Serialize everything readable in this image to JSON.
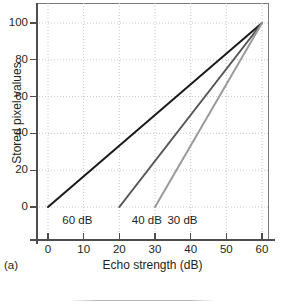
{
  "panel": {
    "caption": "(a)"
  },
  "chart_data": {
    "type": "line",
    "title": "",
    "xlabel": "Echo strength (dB)",
    "ylabel": "Stored pixel values",
    "xlim": [
      -5,
      65
    ],
    "ylim": [
      -12,
      108
    ],
    "xticks": [
      0,
      10,
      20,
      30,
      40,
      50,
      60
    ],
    "yticks": [
      0,
      20,
      40,
      60,
      80,
      100
    ],
    "xtick_labels": [
      "0",
      "10",
      "20",
      "30",
      "40",
      "50",
      "60"
    ],
    "ytick_labels": [
      "0",
      "20",
      "40",
      "60",
      "80",
      "100"
    ],
    "grid": true,
    "grid_style": "dotted",
    "legend": "inline-annotations",
    "series": [
      {
        "name": "60 dB",
        "label": "60 dB",
        "color": "#1a1a1a",
        "x": [
          0,
          60
        ],
        "y": [
          0,
          100
        ],
        "label_x": 4,
        "label_y": -7
      },
      {
        "name": "40 dB",
        "label": "40 dB",
        "color": "#555555",
        "x": [
          20,
          60
        ],
        "y": [
          0,
          100
        ],
        "label_x": 23.5,
        "label_y": -7
      },
      {
        "name": "30 dB",
        "label": "30 dB",
        "color": "#9a9a9a",
        "x": [
          30,
          60
        ],
        "y": [
          0,
          100
        ],
        "label_x": 33.5,
        "label_y": -7
      }
    ]
  },
  "colors": {
    "axis": "#4d4d4d",
    "frame": "#7a7a7a",
    "grid": "#c8c8cc",
    "text": "#231f20"
  }
}
